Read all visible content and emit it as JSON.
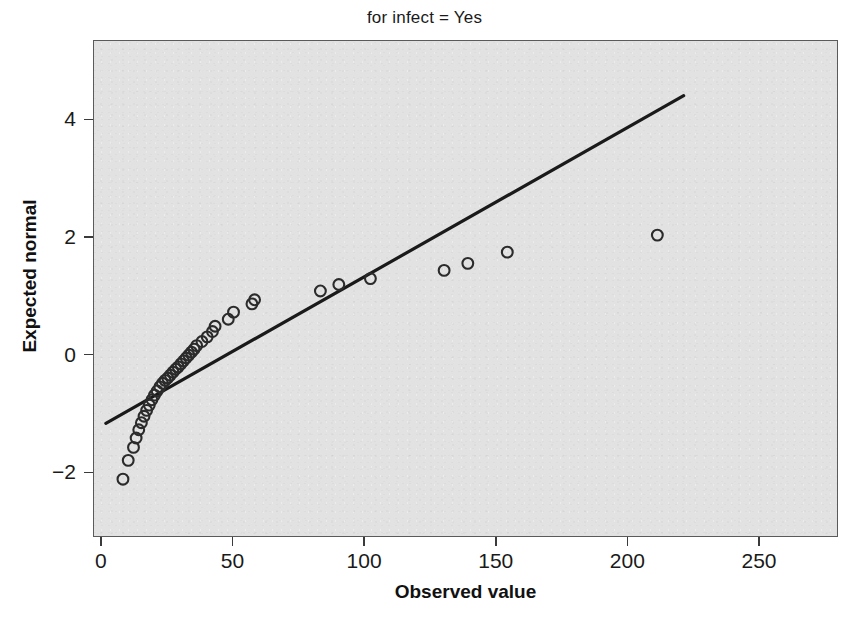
{
  "chart_data": {
    "type": "scatter",
    "title": "",
    "subtitle": "for infect = Yes",
    "xlabel": "Observed value",
    "ylabel": "Expected normal",
    "xlim": [
      -3,
      280
    ],
    "ylim": [
      -3.1,
      5.35
    ],
    "xticks": [
      0,
      50,
      100,
      150,
      200,
      250
    ],
    "yticks": [
      -2,
      0,
      2,
      4
    ],
    "xtick_labels": [
      "0",
      "50",
      "100",
      "150",
      "200",
      "250"
    ],
    "ytick_labels": [
      "-2",
      "0",
      "2",
      "4"
    ],
    "grid": false,
    "legend": false,
    "panel_background": "#e2e2e2",
    "marker": "open-circle",
    "marker_color": "#2b2b2b",
    "line_color": "#1a1a1a",
    "points": [
      {
        "x": 8,
        "y": -2.1
      },
      {
        "x": 10,
        "y": -1.78
      },
      {
        "x": 12,
        "y": -1.56
      },
      {
        "x": 13,
        "y": -1.4
      },
      {
        "x": 14,
        "y": -1.26
      },
      {
        "x": 15,
        "y": -1.14
      },
      {
        "x": 16,
        "y": -1.03
      },
      {
        "x": 17,
        "y": -0.93
      },
      {
        "x": 18,
        "y": -0.84
      },
      {
        "x": 19,
        "y": -0.75
      },
      {
        "x": 20,
        "y": -0.67
      },
      {
        "x": 21,
        "y": -0.6
      },
      {
        "x": 22,
        "y": -0.53
      },
      {
        "x": 23,
        "y": -0.47
      },
      {
        "x": 24,
        "y": -0.42
      },
      {
        "x": 25,
        "y": -0.38
      },
      {
        "x": 26,
        "y": -0.33
      },
      {
        "x": 27,
        "y": -0.28
      },
      {
        "x": 28,
        "y": -0.23
      },
      {
        "x": 29,
        "y": -0.19
      },
      {
        "x": 30,
        "y": -0.14
      },
      {
        "x": 31,
        "y": -0.09
      },
      {
        "x": 32,
        "y": -0.04
      },
      {
        "x": 33,
        "y": 0.01
      },
      {
        "x": 34,
        "y": 0.06
      },
      {
        "x": 35,
        "y": 0.11
      },
      {
        "x": 36,
        "y": 0.17
      },
      {
        "x": 38,
        "y": 0.24
      },
      {
        "x": 40,
        "y": 0.32
      },
      {
        "x": 42,
        "y": 0.41
      },
      {
        "x": 43,
        "y": 0.5
      },
      {
        "x": 48,
        "y": 0.62
      },
      {
        "x": 50,
        "y": 0.74
      },
      {
        "x": 57,
        "y": 0.88
      },
      {
        "x": 58,
        "y": 0.95
      },
      {
        "x": 83,
        "y": 1.1
      },
      {
        "x": 90,
        "y": 1.21
      },
      {
        "x": 102,
        "y": 1.31
      },
      {
        "x": 130,
        "y": 1.45
      },
      {
        "x": 139,
        "y": 1.57
      },
      {
        "x": 154,
        "y": 1.76
      },
      {
        "x": 211,
        "y": 2.05
      }
    ],
    "reference_line": {
      "x_start": 1.5,
      "y_start": -1.15,
      "x_end": 221,
      "y_end": 4.42
    }
  }
}
